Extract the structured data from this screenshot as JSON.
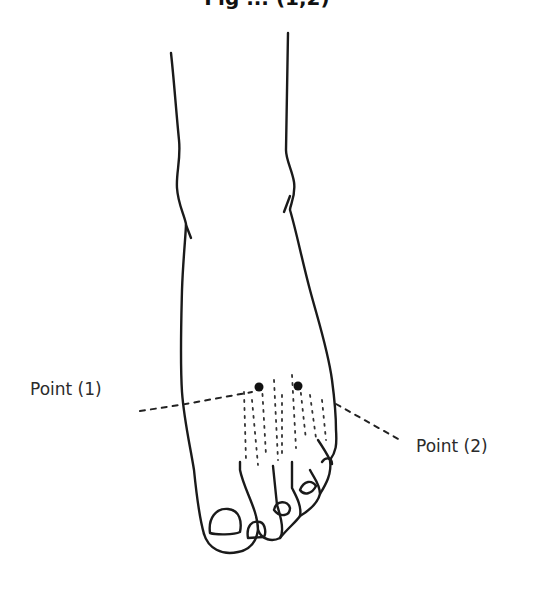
{
  "title": {
    "text": "Fig ... (1,2)",
    "note": "clipped at top edge"
  },
  "figure": {
    "points": [
      {
        "id": 1,
        "label": "Point (1)"
      },
      {
        "id": 2,
        "label": "Point (2)"
      }
    ]
  },
  "colors": {
    "line": "#1a1a1a",
    "label": "#2b2b2b",
    "background": "#ffffff"
  }
}
